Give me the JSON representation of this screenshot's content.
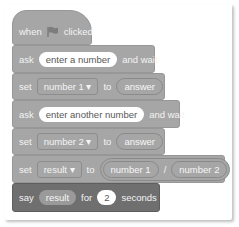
{
  "script": {
    "hat": {
      "when": "when",
      "icon": "green-flag-icon",
      "clicked": "clicked"
    },
    "ask1": {
      "keyword": "ask",
      "prompt": "enter a number",
      "suffix": "and wait"
    },
    "set1": {
      "keyword": "set",
      "variable": "number 1",
      "to": "to",
      "value": "answer"
    },
    "ask2": {
      "keyword": "ask",
      "prompt": "enter another number",
      "suffix": "and wait"
    },
    "set2": {
      "keyword": "set",
      "variable": "number 2",
      "to": "to",
      "value": "answer"
    },
    "set3": {
      "keyword": "set",
      "variable": "result",
      "to": "to",
      "left": "number 1",
      "operator": "/",
      "right": "number 2"
    },
    "say": {
      "keyword": "say",
      "value": "result",
      "for": "for",
      "seconds_value": "2",
      "seconds": "seconds"
    }
  },
  "colors": {
    "block": "#a6a6a6",
    "say_block": "#6f6f6f",
    "background": "#ffffff"
  },
  "dropdown_arrow": "▾"
}
